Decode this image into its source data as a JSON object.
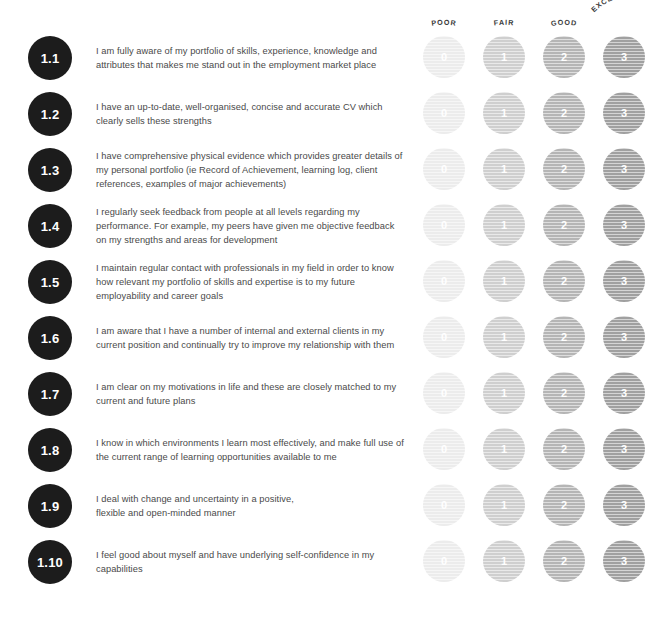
{
  "document": {
    "title": "Self-assessment rating grid"
  },
  "scale_headers": [
    {
      "label": "POOR",
      "value": "0",
      "color": "#ececec",
      "curve": "slight"
    },
    {
      "label": "FAIR",
      "value": "1",
      "color": "#cfcfcf",
      "curve": "slight"
    },
    {
      "label": "GOOD",
      "value": "2",
      "color": "#b5b5b5",
      "curve": "slight"
    },
    {
      "label": "EXCELLENT",
      "value": "3",
      "color": "#a0a0a0",
      "curve": "strong"
    }
  ],
  "scale_values": [
    "0",
    "1",
    "2",
    "3"
  ],
  "columns_x": [
    444,
    504,
    564,
    624
  ],
  "rows": [
    {
      "number": "1.1",
      "statement": "I am fully aware of my portfolio of skills, experience, knowledge and attributes that makes me stand out in the employment market place"
    },
    {
      "number": "1.2",
      "statement": "I have an up-to-date, well-organised, concise and accurate CV which clearly sells these strengths"
    },
    {
      "number": "1.3",
      "statement": "I have comprehensive physical evidence which provides greater details of my personal portfolio (ie Record of Achievement, learning log, client references, examples of major achievements)"
    },
    {
      "number": "1.4",
      "statement": "I regularly seek feedback from people at all levels regarding my performance.  For example, my peers have given me objective feedback on my strengths and areas for development"
    },
    {
      "number": "1.5",
      "statement": "I maintain regular contact with professionals in my field in order to know how relevant my portfolio of skills and expertise is to my future employability and career goals"
    },
    {
      "number": "1.6",
      "statement": "I am aware that I have a number of internal and external clients in my current position and continually try to improve my relationship with them"
    },
    {
      "number": "1.7",
      "statement": "I am clear on my motivations in life and these are closely matched to my current and future plans"
    },
    {
      "number": "1.8",
      "statement": "I know in which environments I learn most effectively, and make full use of the current range of learning opportunities available to me"
    },
    {
      "number": "1.9",
      "statement": "I deal with change and uncertainty in a positive,\nflexible and open-minded manner"
    },
    {
      "number": "1.10",
      "statement": "I feel good about myself and have underlying self-confidence in my capabilities"
    }
  ],
  "layout": {
    "row_tops": [
      30,
      86,
      142,
      198,
      254,
      310,
      366,
      422,
      478,
      534
    ],
    "badge_color": "#1c1c1c",
    "text_color": "#4a4a4a"
  }
}
